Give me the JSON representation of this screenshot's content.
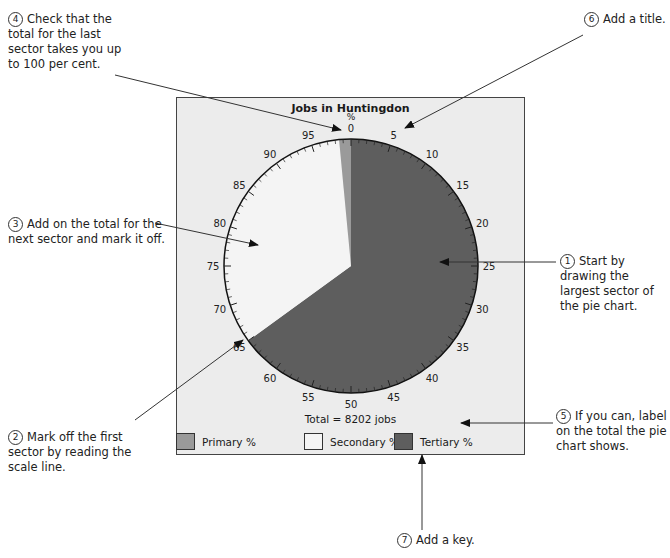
{
  "notes": [
    {
      "id": 1,
      "num": "1",
      "text": [
        "Start by",
        "drawing the",
        "largest sector of",
        "the pie chart."
      ]
    },
    {
      "id": 2,
      "num": "2",
      "text": [
        "Mark off the first",
        "sector by reading the",
        "scale line."
      ]
    },
    {
      "id": 3,
      "num": "3",
      "text": [
        "Add on the total for the",
        "next sector and mark it off."
      ]
    },
    {
      "id": 4,
      "num": "4",
      "text": [
        "Check that the",
        "total for the last",
        "sector takes you up",
        "to 100 per cent."
      ]
    },
    {
      "id": 5,
      "num": "5",
      "text": [
        "If you can, label",
        "on the total the pie",
        "chart shows."
      ]
    },
    {
      "id": 6,
      "num": "6",
      "text": [
        "Add a title."
      ]
    },
    {
      "id": 7,
      "num": "7",
      "text": [
        "Add a key."
      ]
    }
  ],
  "chart": {
    "title": "Jobs in Huntingdon",
    "scale_unit": "%",
    "total_label": "Total = 8202 jobs"
  },
  "legend": [
    {
      "label": "Primary %",
      "color": "#9a9a9a"
    },
    {
      "label": "Secondary %",
      "color": "#f4f4f4"
    },
    {
      "label": "Tertiary %",
      "color": "#5e5e5e"
    }
  ],
  "chart_data": {
    "type": "pie",
    "title": "Jobs in Huntingdon",
    "subtitle": "Total = 8202 jobs",
    "categories": [
      "Tertiary %",
      "Secondary %",
      "Primary %"
    ],
    "values": [
      65,
      33.5,
      1.5
    ],
    "colors": [
      "#5e5e5e",
      "#f4f4f4",
      "#9a9a9a"
    ],
    "scale_ticks": [
      0,
      5,
      10,
      15,
      20,
      25,
      30,
      35,
      40,
      45,
      50,
      55,
      60,
      65,
      70,
      75,
      80,
      85,
      90,
      95
    ],
    "scale_unit": "%",
    "legend_position": "bottom",
    "total": 8202
  }
}
